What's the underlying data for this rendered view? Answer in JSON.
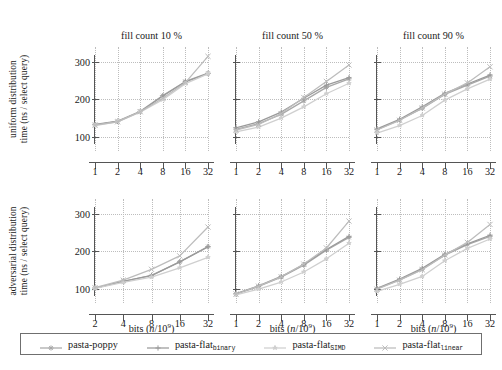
{
  "figure": {
    "width": 502,
    "height": 370,
    "background": "#ffffff"
  },
  "axis": {
    "xlabel_text": "bits (",
    "xlabel_var": "n",
    "xlabel_div": "/10",
    "xlabel_exp": "9",
    "xlabel_close": ")",
    "xlabel_full": "bits (n/10^9)",
    "ylabel_common": "time (ns / select query)",
    "yticks": [
      100,
      200,
      300
    ],
    "ylim": [
      62,
      340
    ],
    "xticks_6": [
      1,
      2,
      4,
      8,
      16,
      32
    ],
    "xticks_5": [
      2,
      4,
      8,
      16,
      32
    ]
  },
  "rows": [
    {
      "id": "uniform",
      "line1": "uniform distribution",
      "line2": "time (ns / select query)"
    },
    {
      "id": "adversarial",
      "line1": "adversarial distribution",
      "line2": "time (ns / select query)"
    }
  ],
  "columns": [
    {
      "title": "fill count 10 %"
    },
    {
      "title": "fill count 50 %"
    },
    {
      "title": "fill count 90 %"
    }
  ],
  "legend": {
    "items": [
      {
        "label": "pasta-poppy",
        "sub": "",
        "color": "#a8a8a8",
        "marker": "asterisk"
      },
      {
        "label": "pasta-flat",
        "sub": "binary",
        "color": "#9a9a9a",
        "marker": "plus"
      },
      {
        "label": "pasta-flat",
        "sub": "SIMD",
        "color": "#cfcfcf",
        "marker": "star"
      },
      {
        "label": "pasta-flat",
        "sub": "linear",
        "color": "#bcbcbc",
        "marker": "cross"
      }
    ]
  },
  "chart_data": {
    "type": "line",
    "xlabel": "bits (n/10^9)",
    "ylabel": "time (ns / select query)",
    "xscale": "log2",
    "ylim": [
      62,
      340
    ],
    "grid": true,
    "legend_position": "bottom",
    "series_names": [
      "pasta-poppy",
      "pasta-flat_binary",
      "pasta-flat_SIMD",
      "pasta-flat_linear"
    ],
    "panels": [
      {
        "row": "uniform distribution",
        "column": "fill count 10 %",
        "x": [
          1,
          2,
          4,
          8,
          16,
          32
        ],
        "series": [
          {
            "name": "pasta-poppy",
            "values": [
              133,
              142,
              168,
              210,
              248,
              270
            ]
          },
          {
            "name": "pasta-flat_binary",
            "values": [
              132,
              141,
              167,
              209,
              247,
              269
            ]
          },
          {
            "name": "pasta-flat_SIMD",
            "values": [
              130,
              140,
              166,
              199,
              242,
              268
            ]
          },
          {
            "name": "pasta-flat_linear",
            "values": [
              131,
              140,
              167,
              203,
              245,
              315
            ]
          }
        ]
      },
      {
        "row": "uniform distribution",
        "column": "fill count 50 %",
        "x": [
          1,
          2,
          4,
          8,
          16,
          32
        ],
        "series": [
          {
            "name": "pasta-poppy",
            "values": [
              120,
              135,
              160,
              196,
              232,
              255
            ]
          },
          {
            "name": "pasta-flat_binary",
            "values": [
              124,
              140,
              166,
              203,
              238,
              258
            ]
          },
          {
            "name": "pasta-flat_SIMD",
            "values": [
              113,
              126,
              150,
              180,
              215,
              243
            ]
          },
          {
            "name": "pasta-flat_linear",
            "values": [
              118,
              133,
              162,
              205,
              248,
              292
            ]
          }
        ]
      },
      {
        "row": "uniform distribution",
        "column": "fill count 90 %",
        "x": [
          1,
          2,
          4,
          8,
          16,
          32
        ],
        "series": [
          {
            "name": "pasta-poppy",
            "values": [
              119,
              145,
              176,
              213,
              238,
              262
            ]
          },
          {
            "name": "pasta-flat_binary",
            "values": [
              121,
              147,
              180,
              216,
              241,
              265
            ]
          },
          {
            "name": "pasta-flat_SIMD",
            "values": [
              110,
              130,
              157,
              198,
              228,
              254
            ]
          },
          {
            "name": "pasta-flat_linear",
            "values": [
              118,
              144,
              177,
              214,
              244,
              287
            ]
          }
        ]
      },
      {
        "row": "adversarial distribution",
        "column": "fill count 10 %",
        "x": [
          2,
          4,
          8,
          16,
          32
        ],
        "series": [
          {
            "name": "pasta-poppy",
            "values": [
              102,
              120,
              135,
              172,
              213
            ]
          },
          {
            "name": "pasta-flat_binary",
            "values": [
              102,
              120,
              136,
              172,
              212
            ]
          },
          {
            "name": "pasta-flat_SIMD",
            "values": [
              101,
              117,
              131,
              156,
              184
            ]
          },
          {
            "name": "pasta-flat_linear",
            "values": [
              103,
              123,
              152,
              188,
              265
            ]
          }
        ]
      },
      {
        "row": "adversarial distribution",
        "column": "fill count 50 %",
        "x": [
          1,
          2,
          4,
          8,
          16,
          32
        ],
        "series": [
          {
            "name": "pasta-poppy",
            "values": [
              86,
              106,
              131,
              163,
              203,
              237
            ]
          },
          {
            "name": "pasta-flat_binary",
            "values": [
              87,
              108,
              133,
              165,
              205,
              240
            ]
          },
          {
            "name": "pasta-flat_SIMD",
            "values": [
              84,
              99,
              118,
              145,
              180,
              222
            ]
          },
          {
            "name": "pasta-flat_linear",
            "values": [
              86,
              107,
              132,
              166,
              209,
              281
            ]
          }
        ]
      },
      {
        "row": "adversarial distribution",
        "column": "fill count 90 %",
        "x": [
          1,
          2,
          4,
          8,
          16,
          32
        ],
        "series": [
          {
            "name": "pasta-poppy",
            "values": [
              100,
              124,
              152,
              190,
              218,
              240
            ]
          },
          {
            "name": "pasta-flat_binary",
            "values": [
              101,
              126,
              155,
              192,
              220,
              243
            ]
          },
          {
            "name": "pasta-flat_SIMD",
            "values": [
              93,
              112,
              133,
              175,
              208,
              233
            ]
          },
          {
            "name": "pasta-flat_linear",
            "values": [
              99,
              123,
              151,
              190,
              224,
              272
            ]
          }
        ]
      }
    ]
  }
}
